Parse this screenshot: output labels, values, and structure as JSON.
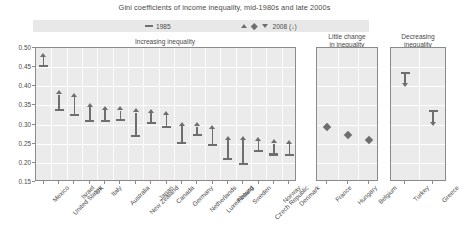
{
  "title": "Gini coefficients of income inequality, mid-1980s and late 2000s",
  "legend": {
    "item_1985": {
      "label": "1985",
      "marker": "dash-icon"
    },
    "item_2008": {
      "label": "2008 (↓)",
      "markers": [
        "triangle-up-icon",
        "diamond-icon",
        "triangle-down-icon"
      ]
    }
  },
  "axis": {
    "ticks": [
      "0.50",
      "0.45",
      "0.40",
      "0.35",
      "0.30",
      "0.25",
      "0.20",
      "0.15"
    ],
    "min": 0.15,
    "max": 0.5,
    "step": 0.05
  },
  "panels": [
    {
      "id": "increasing",
      "title": "Increasing inequality"
    },
    {
      "id": "little-change",
      "title": "Little change\nin inequality",
      "title_line1": "Little change",
      "title_line2": "in inequality"
    },
    {
      "id": "decreasing",
      "title": "Decreasing\ninequality",
      "title_line1": "Decreasing",
      "title_line2": "inequality"
    }
  ],
  "chart_data": {
    "type": "scatter",
    "title": "Gini coefficients of income inequality, mid-1980s and late 2000s",
    "xlabel": "",
    "ylabel": "Gini coefficient",
    "ylim": [
      0.15,
      0.5
    ],
    "grid": true,
    "legend_position": "top",
    "series": [
      {
        "name": "1985",
        "marker": "horizontal-bar"
      },
      {
        "name": "2008",
        "marker": "triangle-up / diamond / triangle-down"
      }
    ],
    "panels": [
      {
        "name": "Increasing inequality",
        "direction": "up",
        "categories": [
          "Mexico",
          "United States",
          "Israel",
          "UK",
          "Italy",
          "Australia",
          "New Zealand",
          "Japan",
          "Canada",
          "Germany",
          "Netherlands",
          "Luxembourg",
          "Finland",
          "Sweden",
          "Czech Republic",
          "Norway",
          "Denmark"
        ],
        "v1985": [
          0.452,
          0.337,
          0.326,
          0.309,
          0.309,
          0.312,
          0.271,
          0.304,
          0.293,
          0.251,
          0.272,
          0.247,
          0.209,
          0.198,
          0.232,
          0.222,
          0.221
        ],
        "v2008": [
          0.476,
          0.378,
          0.371,
          0.345,
          0.337,
          0.336,
          0.33,
          0.329,
          0.324,
          0.295,
          0.294,
          0.288,
          0.259,
          0.259,
          0.256,
          0.25,
          0.248
        ]
      },
      {
        "name": "Little change in inequality",
        "direction": "flat",
        "categories": [
          "France",
          "Hungary",
          "Belgium"
        ],
        "v1985": [
          0.3,
          0.272,
          0.259
        ],
        "v2008": [
          0.293,
          0.272,
          0.259
        ]
      },
      {
        "name": "Decreasing inequality",
        "direction": "down",
        "categories": [
          "Turkey",
          "Greece"
        ],
        "v1985": [
          0.434,
          0.336
        ],
        "v2008": [
          0.409,
          0.307
        ]
      }
    ]
  }
}
